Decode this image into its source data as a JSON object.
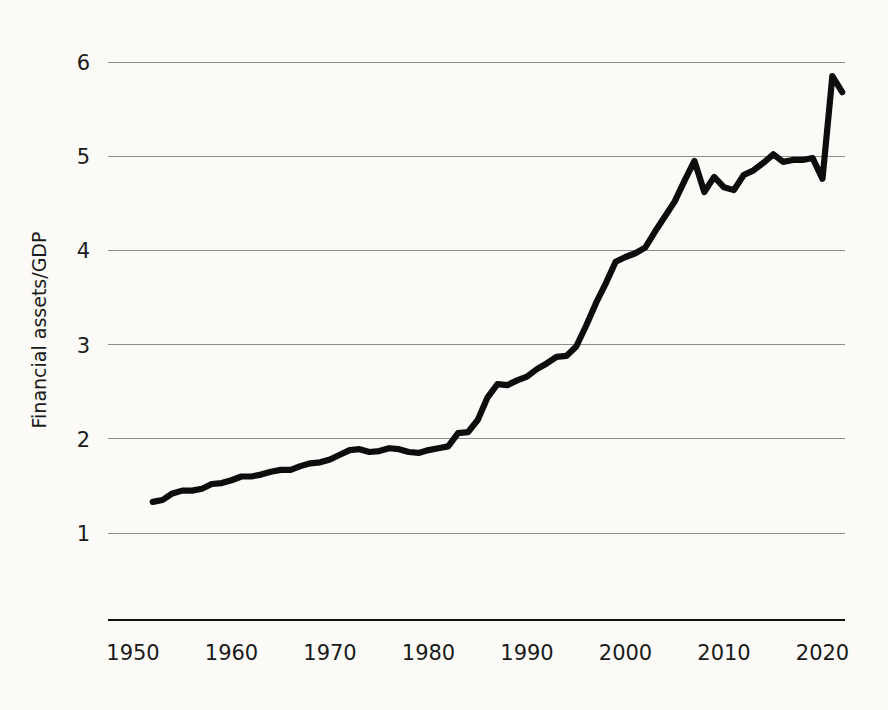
{
  "chart_data": {
    "type": "line",
    "title": "",
    "xlabel": "",
    "ylabel": "Financial assets/GDP",
    "xlim": [
      1950,
      2023
    ],
    "ylim": [
      0.5,
      6.3
    ],
    "grid": true,
    "legend": "none",
    "x_ticks": [
      "1950",
      "1960",
      "1970",
      "1980",
      "1990",
      "2000",
      "2010",
      "2020"
    ],
    "x_tick_values": [
      1950,
      1960,
      1970,
      1980,
      1990,
      2000,
      2010,
      2020
    ],
    "y_ticks": [
      "1",
      "2",
      "3",
      "4",
      "5",
      "6"
    ],
    "y_tick_values": [
      1,
      2,
      3,
      4,
      5,
      6
    ],
    "series": [
      {
        "name": "Financial assets/GDP",
        "color": "#0d0d0d",
        "x": [
          1952,
          1953,
          1954,
          1955,
          1956,
          1957,
          1958,
          1959,
          1960,
          1961,
          1962,
          1963,
          1964,
          1965,
          1966,
          1967,
          1968,
          1969,
          1970,
          1971,
          1972,
          1973,
          1974,
          1975,
          1976,
          1977,
          1978,
          1979,
          1980,
          1981,
          1982,
          1983,
          1984,
          1985,
          1986,
          1987,
          1988,
          1989,
          1990,
          1991,
          1992,
          1993,
          1994,
          1995,
          1996,
          1997,
          1998,
          1999,
          2000,
          2001,
          2002,
          2003,
          2004,
          2005,
          2006,
          2007,
          2008,
          2009,
          2010,
          2011,
          2012,
          2013,
          2014,
          2015,
          2016,
          2017,
          2018,
          2019,
          2020,
          2021,
          2022
        ],
        "y": [
          1.33,
          1.35,
          1.42,
          1.45,
          1.45,
          1.47,
          1.52,
          1.53,
          1.56,
          1.6,
          1.6,
          1.62,
          1.65,
          1.67,
          1.67,
          1.71,
          1.74,
          1.75,
          1.78,
          1.83,
          1.88,
          1.89,
          1.86,
          1.87,
          1.9,
          1.89,
          1.86,
          1.85,
          1.88,
          1.9,
          1.92,
          2.06,
          2.07,
          2.2,
          2.44,
          2.58,
          2.57,
          2.62,
          2.66,
          2.74,
          2.8,
          2.87,
          2.88,
          2.98,
          3.2,
          3.44,
          3.65,
          3.88,
          3.93,
          3.97,
          4.03,
          4.2,
          4.36,
          4.52,
          4.74,
          4.95,
          4.62,
          4.78,
          4.67,
          4.64,
          4.8,
          4.85,
          4.93,
          5.02,
          4.94,
          4.96,
          4.96,
          4.98,
          4.76,
          5.85,
          5.68
        ]
      }
    ]
  },
  "axes": {
    "y_axis_title": "Financial assets/GDP"
  },
  "colors": {
    "line": "#0d0d0d",
    "gridline": "#8d8d8d",
    "axis": "#111111",
    "background": "#fbfaf7",
    "text": "#1a1a1a"
  }
}
